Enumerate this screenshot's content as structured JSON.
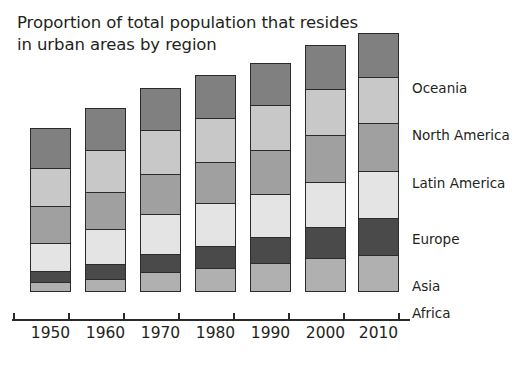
{
  "chart_data": {
    "type": "bar",
    "subtype": "stacked-bar",
    "title": "Proportion of total population that resides\nin urban areas by region",
    "xlabel": "",
    "ylabel": "",
    "grid": false,
    "legend_position": "right",
    "axis": {
      "categories": [
        "1950",
        "1960",
        "1970",
        "1980",
        "1990",
        "2000",
        "2010"
      ],
      "tick_labels": [
        "1950",
        "1960",
        "1970",
        "1980",
        "1990",
        "2000",
        "2010"
      ],
      "y_axis_shown": false,
      "ylim": [
        0,
        100
      ]
    },
    "categories": [
      "1950",
      "1960",
      "1970",
      "1980",
      "1990",
      "2000",
      "2010"
    ],
    "stack_order_bottom_to_top": [
      "Africa",
      "Asia",
      "Europe",
      "Latin America",
      "North America",
      "Oceania"
    ],
    "series": [
      {
        "name": "Africa",
        "color": "#b0b0b0",
        "values": [
          5,
          7,
          11,
          14,
          17,
          20,
          22
        ]
      },
      {
        "name": "Asia",
        "color": "#4a4a4a",
        "values": [
          6,
          8,
          10,
          13,
          16,
          19,
          23
        ]
      },
      {
        "name": "Europe",
        "color": "#e4e4e4",
        "values": [
          17,
          21,
          24,
          26,
          27,
          28,
          29
        ]
      },
      {
        "name": "Latin America",
        "color": "#a0a0a0",
        "values": [
          22,
          22,
          23,
          25,
          27,
          29,
          30
        ]
      },
      {
        "name": "North America",
        "color": "#c8c8c8",
        "values": [
          23,
          25,
          26,
          27,
          28,
          29,
          29
        ]
      },
      {
        "name": "Oceania",
        "color": "#808080",
        "values": [
          24,
          25,
          25,
          26,
          26,
          27,
          27
        ]
      }
    ],
    "bar_totals": [
      97,
      108,
      119,
      131,
      141,
      152,
      160
    ],
    "legend_entries": [
      "Oceania",
      "North America",
      "Latin America",
      "Europe",
      "Asia",
      "Africa"
    ]
  },
  "legend": {
    "items": [
      {
        "label": "Oceania",
        "y": 80
      },
      {
        "label": "North America",
        "y": 127
      },
      {
        "label": "Latin America",
        "y": 175
      },
      {
        "label": "Europe",
        "y": 231
      },
      {
        "label": "Asia",
        "y": 278
      },
      {
        "label": "Africa",
        "y": 305
      }
    ]
  },
  "colors": {
    "background": "#ffffff",
    "text": "#231f20",
    "outline": "#2b2b2b",
    "africa": "#b0b0b0",
    "asia": "#4a4a4a",
    "europe": "#e4e4e4",
    "latin_america": "#a0a0a0",
    "north_america": "#c8c8c8",
    "oceania": "#808080"
  },
  "geometry": {
    "baseline_y": 317,
    "bar_width": 41,
    "bar_left": [
      30,
      85,
      140,
      195,
      250,
      305,
      358
    ],
    "bar_top": [
      153,
      133,
      113,
      100,
      88,
      70,
      58
    ],
    "tick_x": [
      13,
      68,
      123,
      178,
      233,
      288,
      343,
      398
    ]
  }
}
